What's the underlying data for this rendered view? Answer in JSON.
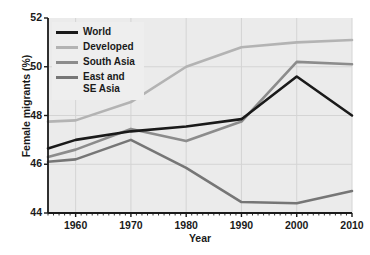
{
  "chart_data": {
    "type": "line",
    "title": "",
    "xlabel": "Year",
    "ylabel": "Female migrants (%)",
    "xlim": [
      1955,
      2010
    ],
    "ylim": [
      44,
      52
    ],
    "yticks": [
      44,
      46,
      48,
      50,
      52
    ],
    "xticks": [
      1960,
      1970,
      1980,
      1990,
      2000,
      2010
    ],
    "grid": true,
    "legend_position": "top-left",
    "x": [
      1955,
      1960,
      1970,
      1980,
      1990,
      2000,
      2010
    ],
    "series": [
      {
        "name": "World",
        "color": "#1a1a1a",
        "values": [
          46.65,
          47.0,
          47.35,
          47.55,
          47.85,
          49.6,
          48.0
        ]
      },
      {
        "name": "Developed",
        "color": "#b3b3b3",
        "values": [
          47.75,
          47.8,
          48.55,
          50.0,
          50.8,
          51.0,
          51.1
        ]
      },
      {
        "name": "South Asia",
        "color": "#8c8c8c",
        "values": [
          46.3,
          46.6,
          47.45,
          46.95,
          47.75,
          50.2,
          50.1
        ]
      },
      {
        "name": "East and\nSE Asia",
        "color": "#767676",
        "values": [
          46.1,
          46.2,
          47.0,
          45.85,
          44.45,
          44.4,
          44.9
        ]
      }
    ]
  },
  "axes": {
    "ylabel": "Female migrants (%)",
    "xlabel": "Year",
    "ytick_labels": [
      "44",
      "46",
      "48",
      "50",
      "52"
    ],
    "xtick_labels": [
      "1960",
      "1970",
      "1980",
      "1990",
      "2000",
      "2010"
    ]
  },
  "legend": {
    "items": [
      {
        "label": "World",
        "color": "#1a1a1a"
      },
      {
        "label": "Developed",
        "color": "#b3b3b3"
      },
      {
        "label": "South Asia",
        "color": "#8c8c8c"
      },
      {
        "label": "East and\nSE Asia",
        "color": "#767676"
      }
    ]
  },
  "style": {
    "plot_background": "#ebebeb",
    "grid_color": "#d4d4d4",
    "axis_color": "#1a1a1a",
    "page_background": "#ffffff"
  }
}
